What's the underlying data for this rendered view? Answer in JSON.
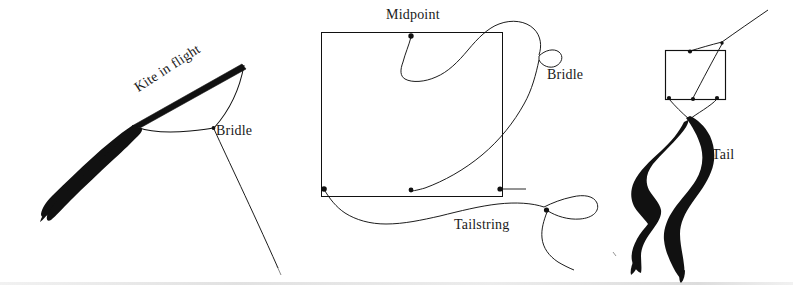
{
  "figure": {
    "background_color": "#ffffff",
    "ink_color": "#111111",
    "width": 793,
    "height": 285,
    "panel_count": 3
  },
  "panels": [
    {
      "id": "kite-in-flight",
      "name": "Kite in flight (side view)",
      "labels": {
        "kite": "Kite in flight",
        "bridle": "Bridle"
      },
      "elements": [
        "diagonal-spar",
        "tail-streamer",
        "bridle-v",
        "flying-line"
      ]
    },
    {
      "id": "kite-flat-layout",
      "name": "Flat layout with bridle and tailstring",
      "labels": {
        "midpoint": "Midpoint",
        "bridle": "Bridle",
        "tailstring": "Tailstring"
      },
      "elements": [
        "sail-square",
        "corner-points",
        "midpoint-point",
        "bridle-string",
        "bridle-loop",
        "tailstring"
      ]
    },
    {
      "id": "kite-with-tail",
      "name": "Assembled kite with tail",
      "labels": {
        "tail": "Tail"
      },
      "elements": [
        "sail-square",
        "bridle-lines",
        "flying-line",
        "tail-streamers"
      ]
    }
  ],
  "labels_flat": [
    "Kite in flight",
    "Bridle",
    "Midpoint",
    "Bridle",
    "Tailstring",
    "Tail"
  ]
}
